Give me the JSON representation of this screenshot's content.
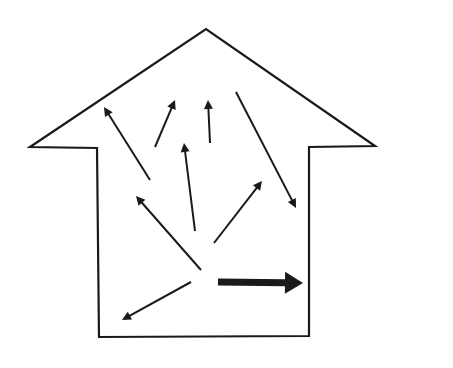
{
  "diagram": {
    "type": "house-shaped outline with internal radiating arrows",
    "background_color": "#ffffff",
    "stroke_color": "#1a1a1a",
    "house_outline": {
      "points": [
        [
          30,
          147
        ],
        [
          206,
          29
        ],
        [
          375,
          146
        ],
        [
          309,
          147
        ],
        [
          309,
          336
        ],
        [
          99,
          337
        ],
        [
          97,
          148
        ]
      ]
    },
    "thin_arrows": [
      {
        "id": "arrow-upper-left",
        "from": [
          150,
          180
        ],
        "to": [
          104,
          107
        ]
      },
      {
        "id": "arrow-up-slight-right",
        "from": [
          155,
          147
        ],
        "to": [
          175,
          100
        ]
      },
      {
        "id": "arrow-up",
        "from": [
          210,
          143
        ],
        "to": [
          208,
          100
        ]
      },
      {
        "id": "arrow-up-center",
        "from": [
          195,
          231
        ],
        "to": [
          184,
          143
        ]
      },
      {
        "id": "arrow-up-right",
        "from": [
          214,
          243
        ],
        "to": [
          262,
          181
        ]
      },
      {
        "id": "arrow-down-right",
        "from": [
          236,
          92
        ],
        "to": [
          296,
          208
        ]
      },
      {
        "id": "arrow-left-up",
        "from": [
          201,
          270
        ],
        "to": [
          136,
          196
        ]
      },
      {
        "id": "arrow-down-left",
        "from": [
          191,
          282
        ],
        "to": [
          122,
          320
        ]
      }
    ],
    "thick_arrow": {
      "id": "arrow-thick-right",
      "from": [
        218,
        282
      ],
      "to": [
        303,
        283
      ],
      "shaft_thickness": 7,
      "head_length": 18,
      "head_width": 22
    }
  }
}
